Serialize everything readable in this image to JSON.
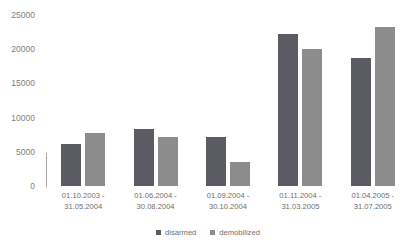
{
  "chart_data": {
    "type": "bar",
    "title": "",
    "xlabel": "",
    "ylabel": "",
    "ylim": [
      0,
      25000
    ],
    "yticks": [
      "0",
      "5000",
      "10000",
      "15000",
      "20000",
      "25000"
    ],
    "grid": false,
    "legend_position": "bottom-center",
    "categories": [
      "01.10.2003 -\n31.05.2004",
      "01.06.2004 -\n30.08.2004",
      "01.09.2004 -\n30.10.2004",
      "01.11.2004 -\n31.03.2005",
      "01.04.2005 -\n31.07.2005"
    ],
    "category_lines": [
      [
        "01.10.2003 -",
        "31.05.2004"
      ],
      [
        "01.06.2004 -",
        "30.08.2004"
      ],
      [
        "01.09.2004 -",
        "30.10.2004"
      ],
      [
        "01.11.2004 -",
        "31.03.2005"
      ],
      [
        "01.04.2005 -",
        "31.07.2005"
      ]
    ],
    "series": [
      {
        "name": "disarmed",
        "color": "#5b5b64",
        "values": [
          6200,
          8400,
          7100,
          22200,
          18700
        ]
      },
      {
        "name": "demobilized",
        "color": "#8c8c8c",
        "values": [
          7700,
          7100,
          3500,
          20100,
          23200
        ]
      }
    ]
  },
  "legend": {
    "items": [
      {
        "label": "disarmed",
        "color": "#5b5b64"
      },
      {
        "label": "demobilized",
        "color": "#8c8c8c"
      }
    ]
  },
  "colors": {
    "background": "#ffffff",
    "tick_text": "#808080",
    "label_text": "#6e6e6e",
    "axis_line": "#a6a6a6"
  }
}
